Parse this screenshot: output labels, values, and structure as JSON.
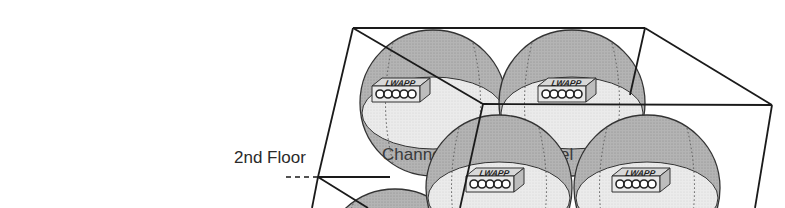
{
  "diagram": {
    "floor_label": "2nd Floor",
    "channel_labels": [
      "Channel",
      "Channel"
    ],
    "access_points": [
      {
        "label": "LWAPP",
        "x": 372,
        "y": 78
      },
      {
        "label": "LWAPP",
        "x": 538,
        "y": 78
      },
      {
        "label": "LWAPP",
        "x": 446,
        "y": 168
      },
      {
        "label": "LWAPP",
        "x": 612,
        "y": 168
      }
    ],
    "colors": {
      "sphere_dark": "#a8a8a8",
      "sphere_light": "#e6e6e6",
      "outline": "#1a1a1a",
      "background": "#ffffff"
    }
  }
}
